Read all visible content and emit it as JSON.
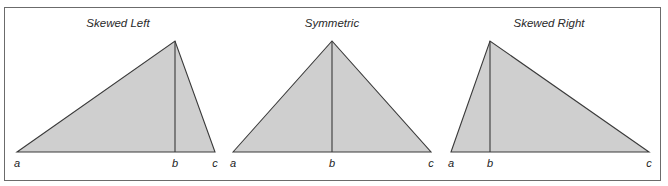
{
  "figure": {
    "cropped_heading_fragment": "g",
    "panels": [
      {
        "title": "Skewed Left",
        "labels": {
          "a": "a",
          "b": "b",
          "c": "c"
        },
        "points": {
          "a": [
            17,
            152
          ],
          "apex": [
            175,
            41
          ],
          "b": [
            175,
            152
          ],
          "c": [
            215,
            152
          ]
        }
      },
      {
        "title": "Symmetric",
        "labels": {
          "a": "a",
          "b": "b",
          "c": "c"
        },
        "points": {
          "a": [
            233,
            152
          ],
          "apex": [
            332,
            41
          ],
          "b": [
            332,
            152
          ],
          "c": [
            431,
            152
          ]
        }
      },
      {
        "title": "Skewed Right",
        "labels": {
          "a": "a",
          "b": "b",
          "c": "c"
        },
        "points": {
          "a": [
            451,
            152
          ],
          "apex": [
            490,
            41
          ],
          "b": [
            490,
            152
          ],
          "c": [
            649,
            152
          ]
        }
      }
    ],
    "colors": {
      "fill": "#cfcfcf",
      "stroke": "#3a3a3a",
      "border": "#6b6b6b"
    }
  }
}
